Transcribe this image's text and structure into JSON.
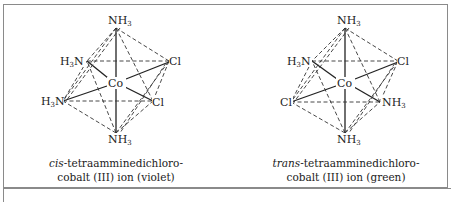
{
  "figure": {
    "panels": [
      {
        "id": "cis",
        "caption_prefix": "cis",
        "caption_line1_rest": "-tetraamminedichloro-",
        "caption_line2": "cobalt (III) ion (violet)",
        "center_label": "Co",
        "ligands": {
          "top": "NH3",
          "upper_left": "H3N",
          "upper_right": "Cl",
          "lower_left": "H3N",
          "lower_right": "Cl",
          "bottom": "NH3"
        }
      },
      {
        "id": "trans",
        "caption_prefix": "trans",
        "caption_line1_rest": "-tetraamminedichloro-",
        "caption_line2": "cobalt (III) ion (green)",
        "center_label": "Co",
        "ligands": {
          "top": "NH3",
          "upper_left": "H3N",
          "upper_right": "Cl",
          "lower_left": "Cl",
          "lower_right": "NH3",
          "bottom": "NH3"
        }
      }
    ],
    "text": {
      "nh": "NH",
      "h": "H",
      "n": "N",
      "three": "3",
      "cl": "Cl",
      "co": "Co"
    },
    "colors": {
      "ink": "#222222",
      "frame": "#8a8a8a",
      "background": "#ffffff"
    }
  }
}
